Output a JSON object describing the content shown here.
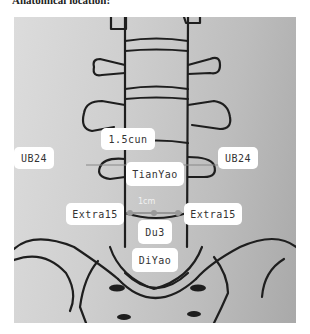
{
  "caption": "Anatomical location:",
  "diagram": {
    "labels": {
      "measure_top": "1.5cun",
      "ub24_left": "UB24",
      "ub24_right": "UB24",
      "tianyao": "TianYao",
      "measure_bottom": "1cm",
      "extra15_left": "Extra15",
      "extra15_right": "Extra15",
      "du3": "Du3",
      "diyao": "DiYao"
    },
    "colors": {
      "background_light": "#dcdcdc",
      "background_dark": "#a9a9a9",
      "line": "#1e1e1e",
      "label_bg": "#ffffff",
      "marker": "#9a9a9a"
    }
  }
}
